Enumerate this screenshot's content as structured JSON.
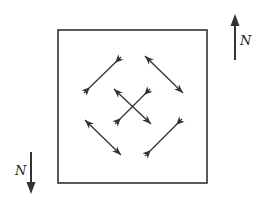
{
  "diagram": {
    "frame": {
      "x": 58,
      "y": 30,
      "w": 149,
      "h": 153,
      "stroke": "#333333"
    },
    "north_arrows": [
      {
        "label": "N",
        "direction": "up",
        "x": 235,
        "y1": 60,
        "y2": 14,
        "label_x": 240,
        "label_y": 45
      },
      {
        "label": "N",
        "direction": "down",
        "x": 31,
        "y1": 152,
        "y2": 194,
        "label_x": 15,
        "label_y": 175
      }
    ],
    "segments": [
      {
        "name": "upper-left-sw-ne",
        "x1": 84,
        "y1": 93,
        "x2": 121,
        "y2": 57,
        "end_style": "inward"
      },
      {
        "name": "upper-right-nw-se",
        "x1": 145,
        "y1": 56,
        "x2": 183,
        "y2": 93,
        "end_style": "outward"
      },
      {
        "name": "center-nw-se",
        "x1": 114,
        "y1": 89,
        "x2": 151,
        "y2": 124,
        "end_style": "outward"
      },
      {
        "name": "center-sw-ne",
        "x1": 115,
        "y1": 124,
        "x2": 150,
        "y2": 89,
        "end_style": "inward"
      },
      {
        "name": "lower-left-nw-se",
        "x1": 85,
        "y1": 120,
        "x2": 121,
        "y2": 155,
        "end_style": "outward"
      },
      {
        "name": "lower-right-sw-ne",
        "x1": 145,
        "y1": 156,
        "x2": 182,
        "y2": 119,
        "end_style": "inward"
      }
    ],
    "line_color": "#333333"
  }
}
